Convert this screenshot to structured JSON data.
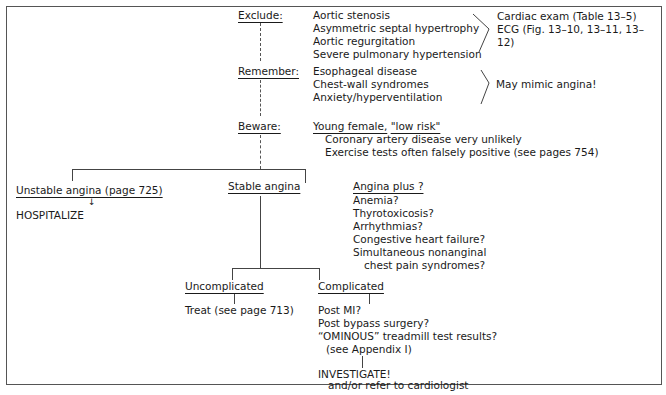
{
  "flowchart": {
    "exclude": {
      "label": "Exclude:",
      "items": [
        "Aortic stenosis",
        "Asymmetric septal hypertrophy",
        "Aortic regurgitation",
        "Severe pulmonary hypertension"
      ],
      "result_lines": [
        "Cardiac exam (Table 13–5)",
        "ECG (Fig. 13–10, 13–11, 13–",
        "12)"
      ]
    },
    "remember": {
      "label": "Remember:",
      "items": [
        "Esophageal disease",
        "Chest-wall syndromes",
        "Anxiety/hyperventilation"
      ],
      "result": "May mimic angina!"
    },
    "beware": {
      "label": "Beware:",
      "heading_part1": "Young female,",
      "heading_part2": "\"low risk\"",
      "items": [
        "Coronary artery disease very unlikely",
        "Exercise tests often falsely positive (see pages 754)"
      ]
    },
    "branches": {
      "unstable": {
        "label": "Unstable angina (page 725)",
        "action": "HOSPITALIZE"
      },
      "stable": {
        "label": "Stable angina"
      },
      "angina_plus": {
        "label": "Angina plus ?",
        "items": [
          "Anemia?",
          "Thyrotoxicosis?",
          "Arrhythmias?",
          "Congestive heart failure?",
          "Simultaneous nonanginal",
          "chest pain syndromes?"
        ]
      }
    },
    "stable_branches": {
      "uncomplicated": {
        "label": "Uncomplicated",
        "action": "Treat (see page 713)"
      },
      "complicated": {
        "label": "Complicated",
        "items": [
          "Post MI?",
          "Post bypass surgery?",
          "“OMINOUS” treadmill test results?",
          "(see Appendix I)"
        ],
        "action_line1": "INVESTIGATE!",
        "action_line2": "and/or refer to cardiologist"
      }
    }
  }
}
